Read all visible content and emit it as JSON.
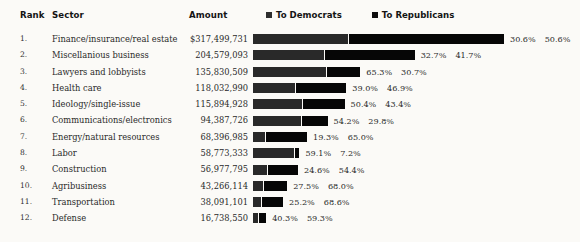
{
  "table": {
    "headers": {
      "rank": "Rank",
      "sector": "Sector",
      "amount": "Amount"
    }
  },
  "legend": {
    "items": [
      {
        "label": "To Democrats",
        "swatch": "legend-swatch-democrats",
        "color": "#2e2e2e"
      },
      {
        "label": "To Republicans",
        "swatch": "legend-swatch-republicans",
        "color": "#0d0d0d"
      }
    ]
  },
  "chart_data": {
    "type": "bar",
    "title": "",
    "subtitle": "",
    "xlabel": "",
    "ylabel": "",
    "orientation": "horizontal",
    "stacked": true,
    "grid": false,
    "legend_position": "top-right",
    "value_axis_max": 317499731,
    "bar_pixel_span": 251,
    "categories": [
      "Finance/insurance/real estate",
      "Miscellanious business",
      "Lawyers and lobbyists",
      "Health care",
      "Ideology/single-issue",
      "Communications/electronics",
      "Energy/natural resources",
      "Labor",
      "Construction",
      "Agribusiness",
      "Transportation",
      "Defense"
    ],
    "series": [
      {
        "name": "To Democrats",
        "color": "#292929",
        "values": [
          30.6,
          32.7,
          65.3,
          39.0,
          50.4,
          54.2,
          19.3,
          59.1,
          24.6,
          27.5,
          25.2,
          40.3
        ],
        "unit": "%"
      },
      {
        "name": "To Republicans",
        "color": "#060606",
        "values": [
          50.6,
          41.7,
          30.7,
          46.9,
          43.4,
          29.8,
          65.0,
          7.2,
          54.4,
          68.0,
          68.6,
          59.3
        ],
        "unit": "%"
      }
    ],
    "amounts": [
      317499731,
      204579093,
      135830509,
      118032990,
      115894928,
      94387726,
      68396985,
      58773333,
      56977795,
      43266114,
      38091101,
      16738550
    ]
  },
  "rows": [
    {
      "rank": "1.",
      "sector": "Finance/insurance/real estate",
      "amount": "$317,499,731",
      "amount_value": 317499731,
      "dem_pct": "30.6%",
      "rep_pct": "50.6%",
      "dem_value": 30.6,
      "rep_value": 50.6
    },
    {
      "rank": "2.",
      "sector": "Miscellanious business",
      "amount": "204,579,093",
      "amount_value": 204579093,
      "dem_pct": "32.7%",
      "rep_pct": "41.7%",
      "dem_value": 32.7,
      "rep_value": 41.7
    },
    {
      "rank": "3.",
      "sector": "Lawyers and lobbyists",
      "amount": "135,830,509",
      "amount_value": 135830509,
      "dem_pct": "65.3%",
      "rep_pct": "30.7%",
      "dem_value": 65.3,
      "rep_value": 30.7
    },
    {
      "rank": "4.",
      "sector": "Health care",
      "amount": "118,032,990",
      "amount_value": 118032990,
      "dem_pct": "39.0%",
      "rep_pct": "46.9%",
      "dem_value": 39.0,
      "rep_value": 46.9
    },
    {
      "rank": "5.",
      "sector": "Ideology/single-issue",
      "amount": "115,894,928",
      "amount_value": 115894928,
      "dem_pct": "50.4%",
      "rep_pct": "43.4%",
      "dem_value": 50.4,
      "rep_value": 43.4
    },
    {
      "rank": "6.",
      "sector": "Communications/electronics",
      "amount": "94,387,726",
      "amount_value": 94387726,
      "dem_pct": "54.2%",
      "rep_pct": "29.8%",
      "dem_value": 54.2,
      "rep_value": 29.8
    },
    {
      "rank": "7.",
      "sector": "Energy/natural resources",
      "amount": "68,396,985",
      "amount_value": 68396985,
      "dem_pct": "19.3%",
      "rep_pct": "65.0%",
      "dem_value": 19.3,
      "rep_value": 65.0
    },
    {
      "rank": "8.",
      "sector": "Labor",
      "amount": "58,773,333",
      "amount_value": 58773333,
      "dem_pct": "59.1%",
      "rep_pct": "7.2%",
      "dem_value": 59.1,
      "rep_value": 7.2
    },
    {
      "rank": "9.",
      "sector": "Construction",
      "amount": "56,977,795",
      "amount_value": 56977795,
      "dem_pct": "24.6%",
      "rep_pct": "54.4%",
      "dem_value": 24.6,
      "rep_value": 54.4
    },
    {
      "rank": "10.",
      "sector": "Agribusiness",
      "amount": "43,266,114",
      "amount_value": 43266114,
      "dem_pct": "27.5%",
      "rep_pct": "68.0%",
      "dem_value": 27.5,
      "rep_value": 68.0
    },
    {
      "rank": "11.",
      "sector": "Transportation",
      "amount": "38,091,101",
      "amount_value": 38091101,
      "dem_pct": "25.2%",
      "rep_pct": "68.6%",
      "dem_value": 25.2,
      "rep_value": 68.6
    },
    {
      "rank": "12.",
      "sector": "Defense",
      "amount": "16,738,550",
      "amount_value": 16738550,
      "dem_pct": "40.3%",
      "rep_pct": "59.3%",
      "dem_value": 40.3,
      "rep_value": 59.3
    }
  ]
}
